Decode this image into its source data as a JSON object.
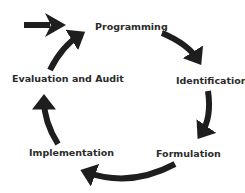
{
  "diagram": {
    "type": "cycle",
    "entry_arrow": true,
    "stroke_color": "#1e1e1e",
    "text_color": "#2b2b2b",
    "background": "#ffffff",
    "nodes": [
      {
        "id": "programming",
        "label": "Programming"
      },
      {
        "id": "identification",
        "label": "Identification"
      },
      {
        "id": "formulation",
        "label": "Formulation"
      },
      {
        "id": "implementation",
        "label": "Implementation"
      },
      {
        "id": "evaluation",
        "label": "Evaluation and Audit"
      }
    ],
    "edges": [
      {
        "from": "entry",
        "to": "programming"
      },
      {
        "from": "programming",
        "to": "identification"
      },
      {
        "from": "identification",
        "to": "formulation"
      },
      {
        "from": "formulation",
        "to": "implementation"
      },
      {
        "from": "implementation",
        "to": "evaluation"
      },
      {
        "from": "evaluation",
        "to": "programming"
      }
    ]
  }
}
